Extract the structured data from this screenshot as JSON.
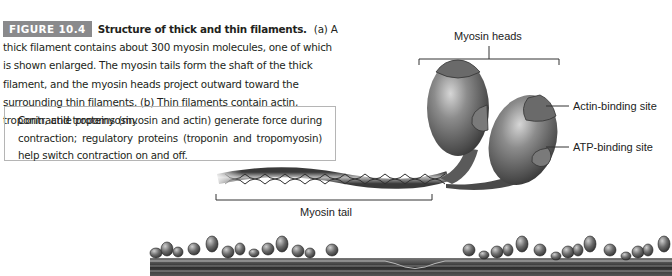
{
  "figure": {
    "badge": "FIGURE 10.4",
    "title": "Structure of thick and thin filaments.",
    "caption": "(a) A thick filament contains about 300 myosin molecules, one of which is shown enlarged. The myosin tails form the shaft of the thick filament, and the myosin heads project outward toward the surrounding thin filaments. (b) Thin filaments contain actin, troponin, and tropomyosin.",
    "badge_color": "#8a8a8c"
  },
  "note": {
    "text": "Contractile proteins (myosin and actin) generate force during contraction; regulatory proteins (troponin and tropomyosin) help switch contraction on and off."
  },
  "diagram": {
    "labels": {
      "myosin_heads": "Myosin heads",
      "actin_binding_site": "Actin-binding site",
      "atp_binding_site": "ATP-binding site",
      "myosin_tail": "Myosin tail"
    }
  }
}
